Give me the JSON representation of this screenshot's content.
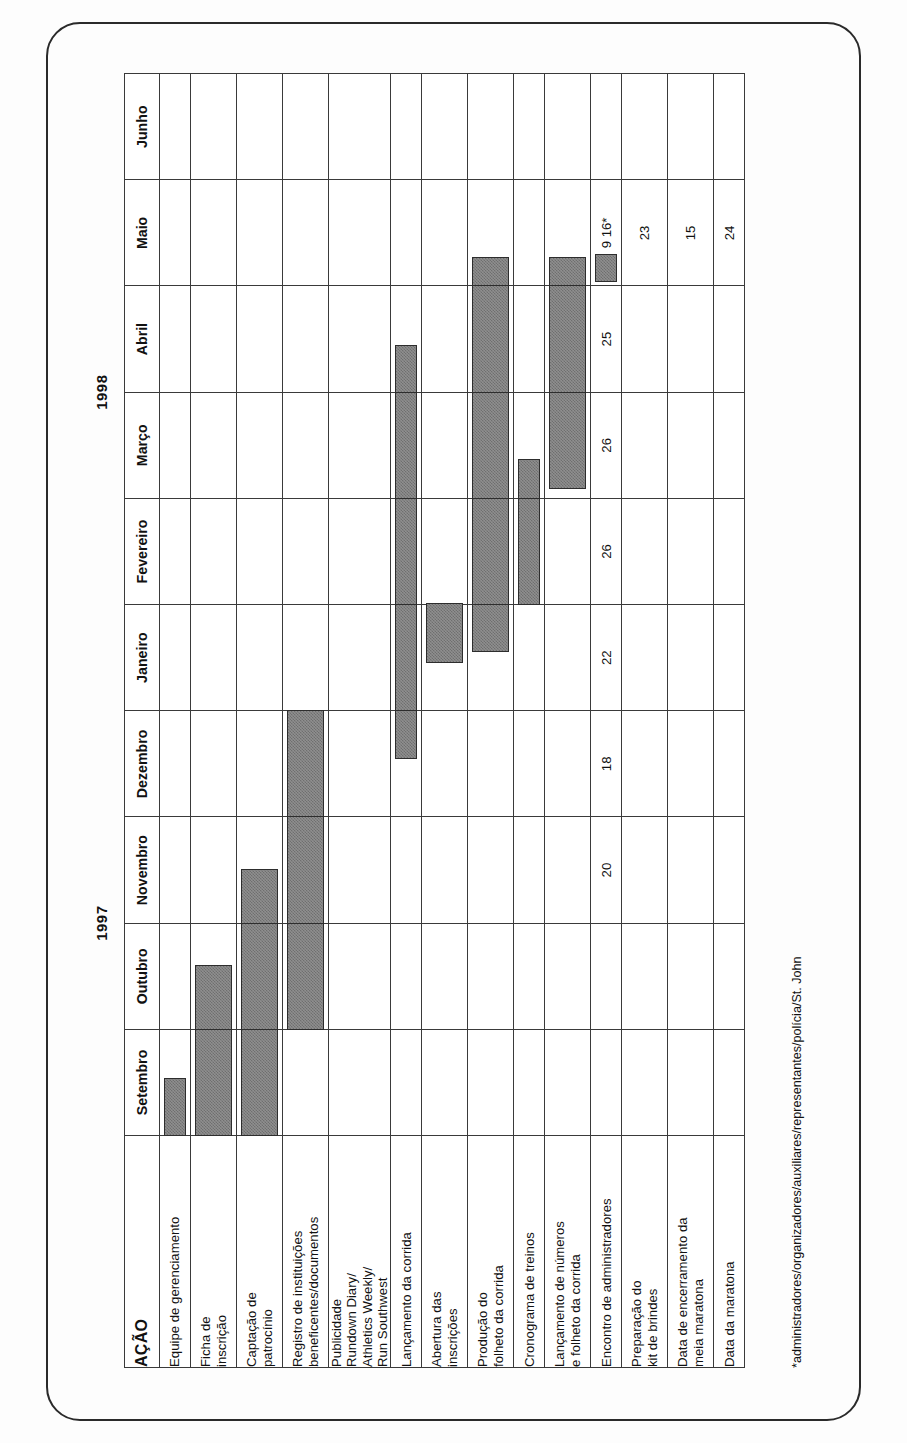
{
  "chart_data": {
    "type": "bar",
    "subtype": "gantt",
    "title": "",
    "xlabel": "",
    "ylabel": "",
    "grid": true,
    "legend": "none",
    "years": [
      {
        "label": "1997",
        "span": 4
      },
      {
        "label": "1998",
        "span": 6
      }
    ],
    "categories": [
      "Setembro",
      "Outubro",
      "Novembro",
      "Dezembro",
      "Janeiro",
      "Fevereiro",
      "Março",
      "Abril",
      "Maio",
      "Junho"
    ],
    "action_header": "AÇÃO",
    "tasks": [
      {
        "label": "Equipe de gerenciamento",
        "rowclass": "taskrow",
        "bars": [
          {
            "month": 0,
            "start": 0.0,
            "end": 0.55
          }
        ],
        "numbers": {}
      },
      {
        "label": "Ficha de\ninscrição",
        "rowclass": "taskrow tall",
        "bars": [
          {
            "month": 0,
            "start": 0.0,
            "end": 1.0
          },
          {
            "month": 1,
            "start": 0.0,
            "end": 0.62
          }
        ],
        "numbers": {}
      },
      {
        "label": "Captação de\npatrocínio",
        "rowclass": "taskrow tall",
        "bars": [
          {
            "month": 0,
            "start": 0.0,
            "end": 1.0
          },
          {
            "month": 1,
            "start": 0.0,
            "end": 1.0
          },
          {
            "month": 2,
            "start": 0.0,
            "end": 0.52
          }
        ],
        "numbers": {}
      },
      {
        "label": "Registro de instituições\nbeneficentes/documentos",
        "rowclass": "taskrow tall",
        "bars": [
          {
            "month": 1,
            "start": 0.0,
            "end": 1.0
          },
          {
            "month": 2,
            "start": 0.0,
            "end": 1.0
          },
          {
            "month": 3,
            "start": 0.0,
            "end": 1.0
          }
        ],
        "numbers": {}
      },
      {
        "label": "Publicidade\nRundown Diary/\nAthletics Weekly/\nRun Southwest",
        "rowclass": "taskrow xtall",
        "bars": [],
        "numbers": {}
      },
      {
        "label": "Lançamento da corrida",
        "rowclass": "taskrow",
        "bars": [
          {
            "month": 3,
            "start": 0.55,
            "end": 1.0
          },
          {
            "month": 4,
            "start": 0.0,
            "end": 1.0
          },
          {
            "month": 5,
            "start": 0.0,
            "end": 1.0
          },
          {
            "month": 6,
            "start": 0.0,
            "end": 1.0
          },
          {
            "month": 7,
            "start": 0.0,
            "end": 0.45
          }
        ],
        "numbers": {}
      },
      {
        "label": "Abertura das\ninscrições",
        "rowclass": "taskrow tall",
        "bars": [
          {
            "month": 4,
            "start": 0.45,
            "end": 1.0
          }
        ],
        "numbers": {}
      },
      {
        "label": "Produção do\nfolheto da corrida",
        "rowclass": "taskrow tall",
        "bars": [
          {
            "month": 4,
            "start": 0.55,
            "end": 1.0
          },
          {
            "month": 5,
            "start": 0.0,
            "end": 1.0
          },
          {
            "month": 6,
            "start": 0.0,
            "end": 1.0
          },
          {
            "month": 7,
            "start": 0.0,
            "end": 1.0
          },
          {
            "month": 8,
            "start": 0.0,
            "end": 0.28
          }
        ],
        "numbers": {}
      },
      {
        "label": "Cronograma de treinos",
        "rowclass": "taskrow",
        "bars": [
          {
            "month": 5,
            "start": 0.0,
            "end": 1.0
          },
          {
            "month": 6,
            "start": 0.0,
            "end": 0.38
          }
        ],
        "numbers": {}
      },
      {
        "label": "Lançamento de números\ne folheto da corrida",
        "rowclass": "taskrow tall",
        "bars": [
          {
            "month": 6,
            "start": 0.08,
            "end": 1.0
          },
          {
            "month": 7,
            "start": 0.0,
            "end": 1.0
          },
          {
            "month": 8,
            "start": 0.0,
            "end": 0.28
          }
        ],
        "numbers": {}
      },
      {
        "label": "Encontro de administradores",
        "rowclass": "taskrow",
        "bars": [
          {
            "month": 8,
            "start": 0.03,
            "end": 0.3
          }
        ],
        "numbers": {
          "2": "20",
          "3": "18",
          "4": "22",
          "5": "26",
          "6": "26",
          "7": "25",
          "8": "9  16*"
        }
      },
      {
        "label": "Preparação do\nkit de brindes",
        "rowclass": "taskrow tall",
        "bars": [],
        "numbers": {
          "8": "23"
        }
      },
      {
        "label": "Data de encerramento da\nmeia maratona",
        "rowclass": "taskrow tall",
        "bars": [],
        "numbers": {
          "8": "15"
        }
      },
      {
        "label": "Data da maratona",
        "rowclass": "taskrow",
        "bars": [],
        "numbers": {
          "8": "24"
        }
      }
    ],
    "footnote": "*administradores/organizadores/auxiliares/representantes/polícia/St. John",
    "colors": {
      "bar_fill": "#8f8f8f",
      "bar_stroke": "#2d2d2d",
      "grid_line": "#3a3a3a",
      "page_background": "#fdfdfd",
      "text": "#111111"
    }
  }
}
